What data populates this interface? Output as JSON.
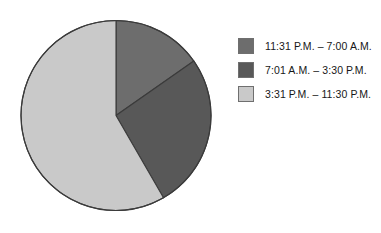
{
  "chart_data": {
    "type": "pie",
    "title": "",
    "categories": [
      "11:31 P.M. – 7:00 A.M.",
      "7:01 A.M. – 3:30 P.M.",
      "3:31 P.M. – 11:30 P.M."
    ],
    "values": [
      15.3,
      26.4,
      58.3
    ],
    "value_unit": "percent",
    "start_angle_deg": 0,
    "direction": "clockwise",
    "slice_colors": [
      "#6d6d6d",
      "#585858",
      "#c9c9c9"
    ],
    "slice_edge_color": "#3b3b3b",
    "legend_position": "right",
    "grid": false,
    "slices": [
      {
        "label": "11:31 P.M. – 7:00 A.M.",
        "value": 15.3,
        "color": "#6d6d6d",
        "start_deg": 0,
        "end_deg": 55
      },
      {
        "label": "7:01 A.M. – 3:30 P.M.",
        "value": 26.4,
        "color": "#585858",
        "start_deg": 55,
        "end_deg": 150
      },
      {
        "label": "3:31 P.M. – 11:30 P.M.",
        "value": 58.3,
        "color": "#c9c9c9",
        "start_deg": 150,
        "end_deg": 360
      }
    ]
  },
  "legend": {
    "items": [
      {
        "label": "11:31 P.M. – 7:00 A.M.",
        "color": "#6d6d6d"
      },
      {
        "label": "7:01 A.M. – 3:30 P.M.",
        "color": "#585858"
      },
      {
        "label": "3:31 P.M. – 11:30 P.M.",
        "color": "#c9c9c9"
      }
    ]
  },
  "colors": {
    "background": "#ffffff",
    "outline": "#3b3b3b",
    "text": "#171717"
  }
}
